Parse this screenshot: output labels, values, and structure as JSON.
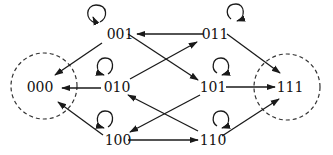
{
  "diagram": {
    "type": "state-transition-graph",
    "nodes": [
      {
        "id": "000",
        "label": "000",
        "x": 40,
        "y": 87,
        "absorbing": true
      },
      {
        "id": "001",
        "label": "001",
        "x": 120,
        "y": 34,
        "absorbing": false
      },
      {
        "id": "010",
        "label": "010",
        "x": 117,
        "y": 87,
        "absorbing": false
      },
      {
        "id": "011",
        "label": "011",
        "x": 215,
        "y": 34,
        "absorbing": false
      },
      {
        "id": "100",
        "label": "100",
        "x": 118,
        "y": 140,
        "absorbing": false
      },
      {
        "id": "101",
        "label": "101",
        "x": 213,
        "y": 87,
        "absorbing": false
      },
      {
        "id": "110",
        "label": "110",
        "x": 213,
        "y": 140,
        "absorbing": false
      },
      {
        "id": "111",
        "label": "111",
        "x": 290,
        "y": 87,
        "absorbing": true
      }
    ],
    "edges": [
      {
        "from": "011",
        "to": "001"
      },
      {
        "from": "001",
        "to": "000"
      },
      {
        "from": "001",
        "to": "101"
      },
      {
        "from": "010",
        "to": "011"
      },
      {
        "from": "011",
        "to": "111"
      },
      {
        "from": "010",
        "to": "000"
      },
      {
        "from": "101",
        "to": "111"
      },
      {
        "from": "101",
        "to": "100"
      },
      {
        "from": "110",
        "to": "010"
      },
      {
        "from": "100",
        "to": "000"
      },
      {
        "from": "100",
        "to": "110"
      },
      {
        "from": "110",
        "to": "111"
      }
    ],
    "self_loops": [
      "001",
      "011",
      "010",
      "101",
      "100",
      "110"
    ],
    "absorbing_states": [
      "000",
      "111"
    ],
    "colors": {
      "line": "#1a1a1a",
      "text": "#111111",
      "background": "#ffffff"
    }
  }
}
